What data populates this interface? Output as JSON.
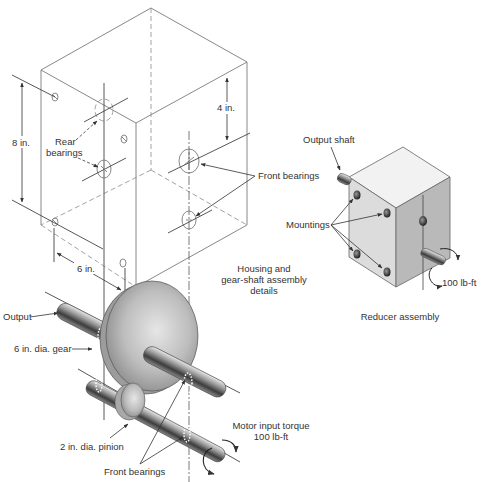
{
  "figure": {
    "housing_caption": [
      "Housing and",
      "gear-shaft assembly",
      "details"
    ],
    "reducer_caption": "Reducer assembly"
  },
  "dimensions": {
    "height": "8 in.",
    "bearing_spacing": "4 in.",
    "depth": "6 in."
  },
  "labels": {
    "rear_bearings": [
      "Rear",
      "bearings"
    ],
    "front_bearings_housing": "Front bearings",
    "output": "Output",
    "gear": "6 in. dia. gear",
    "pinion": "2 in. dia. pinion",
    "front_bearings_shafts": "Front bearings",
    "motor_input": [
      "Motor input torque",
      "100 lb-ft"
    ],
    "output_shaft": "Output shaft",
    "mountings": "Mountings",
    "reducer_torque": "100 lb-ft"
  },
  "colors": {
    "line": "#7a7a7a",
    "text": "#333333",
    "reducer_top": "#f2f2f2",
    "reducer_left": "#dcdcdc",
    "reducer_right": "#b9b9b9"
  }
}
